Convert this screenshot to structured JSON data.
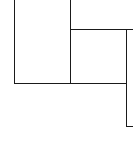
{
  "diagram": {
    "type": "floor-plan-fragment",
    "stroke_color": "#1a1a1a",
    "background_color": "#ffffff",
    "segments": [
      {
        "id": "left-wall",
        "orientation": "vertical",
        "x": 14,
        "y1": 0,
        "y2": 83
      },
      {
        "id": "middle-wall",
        "orientation": "vertical",
        "x": 70,
        "y1": 0,
        "y2": 83
      },
      {
        "id": "right-room-top-wall",
        "orientation": "horizontal",
        "y": 29,
        "x1": 70,
        "x2": 133
      },
      {
        "id": "right-wall",
        "orientation": "vertical",
        "x": 126,
        "y1": 29,
        "y2": 126
      },
      {
        "id": "bottom-wall",
        "orientation": "horizontal",
        "y": 83,
        "x1": 14,
        "x2": 126
      },
      {
        "id": "lower-right-stub",
        "orientation": "horizontal",
        "y": 126,
        "x1": 126,
        "x2": 133
      }
    ]
  }
}
